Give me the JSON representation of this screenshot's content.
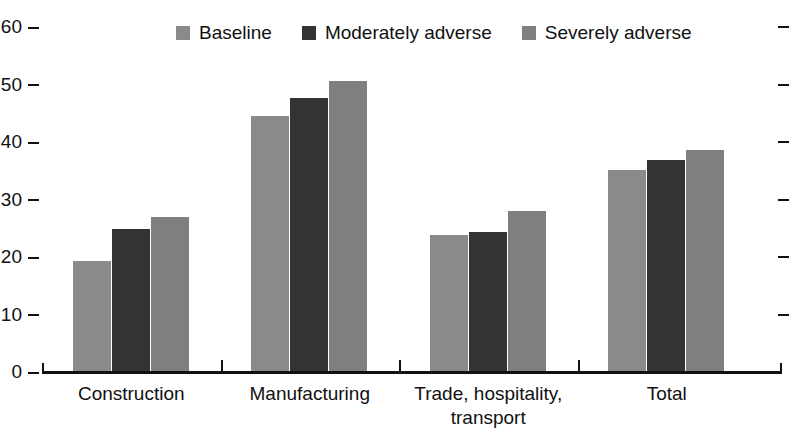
{
  "chart_data": {
    "type": "bar",
    "title": "",
    "subtitle": "",
    "xlabel": "",
    "ylabel": "",
    "ylim": [
      0,
      60
    ],
    "yticks": [
      0,
      10,
      20,
      30,
      40,
      50,
      60
    ],
    "ytick_labels": [
      "0",
      "10",
      "20",
      "30",
      "40",
      "50",
      "60"
    ],
    "grid": false,
    "legend_position": "top-center",
    "categories": [
      "Construction",
      "Manufacturing",
      "Trade, hospitality,\ntransport",
      "Total"
    ],
    "series": [
      {
        "name": "Baseline",
        "color": "#8a8a8a",
        "values": [
          19.3,
          44.6,
          23.9,
          35.2
        ]
      },
      {
        "name": "Moderately adverse",
        "color": "#333333",
        "values": [
          24.9,
          47.7,
          24.3,
          36.8
        ]
      },
      {
        "name": "Severely adverse",
        "color": "#7f7f7f",
        "values": [
          27.0,
          50.6,
          28.0,
          38.6
        ]
      }
    ]
  },
  "legend": {
    "items": [
      {
        "label": "Baseline",
        "color": "#8a8a8a"
      },
      {
        "label": "Moderately adverse",
        "color": "#333333"
      },
      {
        "label": "Severely adverse",
        "color": "#7f7f7f"
      }
    ]
  },
  "axis": {
    "y_tick_labels": [
      "60",
      "50",
      "40",
      "30",
      "20",
      "10",
      "0"
    ]
  }
}
